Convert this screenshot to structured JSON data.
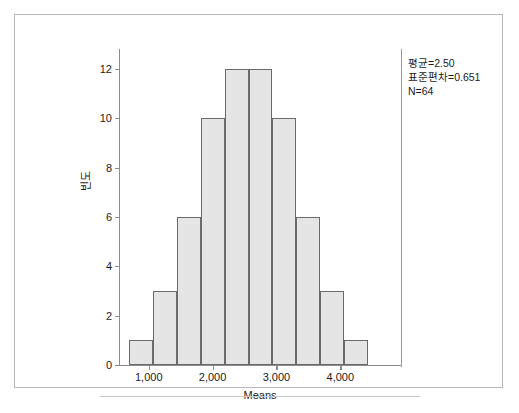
{
  "chart_data": {
    "type": "bar",
    "title": "",
    "subtitle": "",
    "xlabel": "Means",
    "ylabel": "빈도",
    "categories": [
      "1.000",
      "1.375",
      "1.750",
      "2.125",
      "2.500",
      "2.875",
      "3.250",
      "3.625",
      "4.000",
      "4.375"
    ],
    "values": [
      1,
      3,
      6,
      10,
      12,
      12,
      10,
      6,
      3,
      1
    ],
    "bar_centers": [
      0.875,
      1.25,
      1.625,
      2.0,
      2.375,
      2.75,
      3.125,
      3.5,
      3.875,
      4.25
    ],
    "bin_width": 0.375,
    "x_tick_labels": [
      "1,000",
      "2,000",
      "3,000",
      "4,000"
    ],
    "x_tick_values": [
      1.0,
      2.0,
      3.0,
      4.0
    ],
    "xlim": [
      0.55,
      4.95
    ],
    "y_tick_labels": [
      "0",
      "2",
      "4",
      "6",
      "8",
      "10",
      "12"
    ],
    "y_tick_values": [
      0,
      2,
      4,
      6,
      8,
      10,
      12
    ],
    "ylim": [
      0,
      12.8
    ],
    "grid": false,
    "legend": "none",
    "bar_fill_color": "#e5e5e5",
    "bar_edge_color": "#6a6a6a",
    "axis_color": "#8d8d8d",
    "text_color": "#1c1c1c",
    "background_color": "#ffffff",
    "annotations": [
      "평균=2.50",
      "표준편차=0.651",
      "N=64"
    ]
  },
  "stats": {
    "mean_line": "평균=2.50",
    "stdev_line": "표준편차=0.651",
    "n_line": "N=64"
  },
  "axes": {
    "x_title": "Means",
    "y_title": "빈도"
  },
  "caption": {
    "text": ""
  }
}
